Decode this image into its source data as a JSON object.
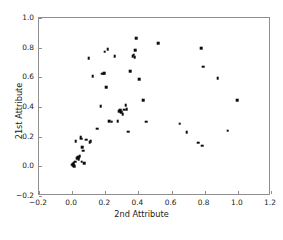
{
  "chart_data": {
    "type": "scatter",
    "title": "",
    "xlabel": "2nd Attribute",
    "ylabel": "21st Attribute",
    "xlim": [
      -0.2,
      1.2
    ],
    "ylim": [
      -0.2,
      1.0
    ],
    "xticks": [
      -0.2,
      0.0,
      0.2,
      0.4,
      0.6,
      0.8,
      1.0,
      1.2
    ],
    "yticks": [
      -0.2,
      0.0,
      0.2,
      0.4,
      0.6,
      0.8,
      1.0
    ],
    "xtick_labels": [
      "−0.2",
      "0.0",
      "0.2",
      "0.4",
      "0.6",
      "0.8",
      "1.0",
      "1.2"
    ],
    "ytick_labels": [
      "−0.2",
      "0.0",
      "0.2",
      "0.4",
      "0.6",
      "0.8",
      "1.0"
    ],
    "grid": false,
    "legend": null,
    "marker": "square",
    "marker_color": "#0d0d0d",
    "marker_size": 2.6,
    "points": [
      [
        0.0,
        0.01
      ],
      [
        0.003,
        0.018
      ],
      [
        0.006,
        0.006
      ],
      [
        0.01,
        0.022
      ],
      [
        0.012,
        0.0
      ],
      [
        0.018,
        0.03
      ],
      [
        0.021,
        0.168
      ],
      [
        0.03,
        0.055
      ],
      [
        0.035,
        0.062
      ],
      [
        0.04,
        0.048
      ],
      [
        0.046,
        0.07
      ],
      [
        0.052,
        0.196
      ],
      [
        0.055,
        0.185
      ],
      [
        0.058,
        0.03
      ],
      [
        0.062,
        0.128
      ],
      [
        0.068,
        0.106
      ],
      [
        0.072,
        0.022
      ],
      [
        0.086,
        0.18
      ],
      [
        0.1,
        0.73
      ],
      [
        0.106,
        0.163
      ],
      [
        0.112,
        0.168
      ],
      [
        0.124,
        0.607
      ],
      [
        0.15,
        0.254
      ],
      [
        0.172,
        0.405
      ],
      [
        0.182,
        0.625
      ],
      [
        0.19,
        0.625
      ],
      [
        0.194,
        0.627
      ],
      [
        0.196,
        0.772
      ],
      [
        0.205,
        0.534
      ],
      [
        0.214,
        0.79
      ],
      [
        0.224,
        0.305
      ],
      [
        0.238,
        0.3
      ],
      [
        0.258,
        0.742
      ],
      [
        0.276,
        0.306
      ],
      [
        0.284,
        0.372
      ],
      [
        0.29,
        0.38
      ],
      [
        0.296,
        0.366
      ],
      [
        0.305,
        0.352
      ],
      [
        0.315,
        0.382
      ],
      [
        0.322,
        0.413
      ],
      [
        0.33,
        0.386
      ],
      [
        0.338,
        0.234
      ],
      [
        0.352,
        0.64
      ],
      [
        0.366,
        0.744
      ],
      [
        0.372,
        0.752
      ],
      [
        0.378,
        0.736
      ],
      [
        0.382,
        0.782
      ],
      [
        0.388,
        0.862
      ],
      [
        0.405,
        0.588
      ],
      [
        0.43,
        0.446
      ],
      [
        0.448,
        0.302
      ],
      [
        0.518,
        0.832
      ],
      [
        0.65,
        0.288
      ],
      [
        0.692,
        0.232
      ],
      [
        0.762,
        0.158
      ],
      [
        0.78,
        0.798
      ],
      [
        0.784,
        0.14
      ],
      [
        0.792,
        0.672
      ],
      [
        0.878,
        0.596
      ],
      [
        0.938,
        0.24
      ],
      [
        0.996,
        0.444
      ]
    ]
  },
  "caption": ""
}
